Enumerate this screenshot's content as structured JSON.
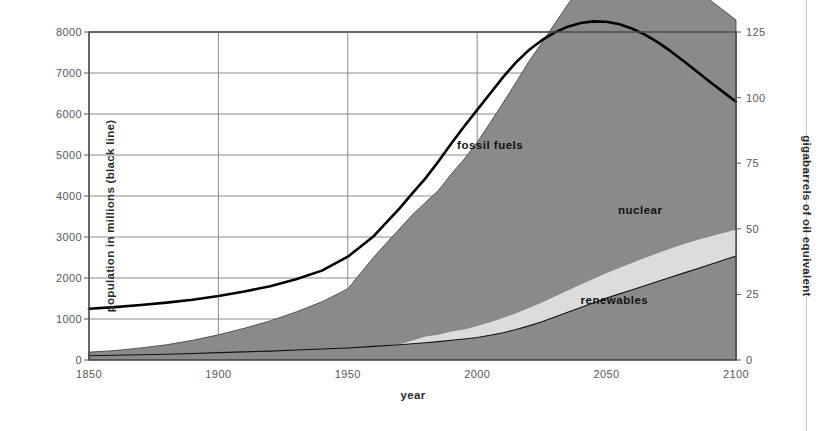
{
  "chart_data": {
    "type": "area",
    "title": "",
    "subtitle": "",
    "xlabel": "year",
    "ylabel": "population in millions (black line)",
    "ylabel_right": "gigabarrels of oil equivalent",
    "xlim": [
      1850,
      2100
    ],
    "ylim": [
      0,
      8000
    ],
    "ylim_right": [
      0,
      125
    ],
    "grid": true,
    "legend_position": "inline-annotations",
    "xticks": [
      1850,
      1900,
      1950,
      2000,
      2050,
      2100
    ],
    "xtick_labels": [
      "1850",
      "1900",
      "1950",
      "2000",
      "2050",
      "2100"
    ],
    "yticks": [
      0,
      1000,
      2000,
      3000,
      4000,
      5000,
      6000,
      7000,
      8000
    ],
    "ytick_labels": [
      "0",
      "1000",
      "2000",
      "3000",
      "4000",
      "5000",
      "6000",
      "7000",
      "8000"
    ],
    "yticks_right": [
      0,
      25,
      50,
      75,
      100,
      125
    ],
    "ytick_labels_right": [
      "0",
      "25",
      "50",
      "75",
      "100",
      "125"
    ],
    "annotations": [
      {
        "text": "fossil fuels",
        "x": 2005,
        "y_right": 82
      },
      {
        "text": "nuclear",
        "x": 2063,
        "y_right": 57
      },
      {
        "text": "renewables",
        "x": 2053,
        "y_right": 23
      }
    ],
    "colors": {
      "fossil_fuels_fill": "#8a8a8a",
      "nuclear_fill": "#dcdcdc",
      "renewables_fill": "#8a8a8a",
      "population_line": "#000000",
      "grid": "#8c8c8c",
      "axis": "#58585a",
      "background": "#ffffff"
    },
    "x": [
      1850,
      1860,
      1870,
      1880,
      1890,
      1900,
      1910,
      1920,
      1930,
      1940,
      1950,
      1960,
      1970,
      1975,
      1980,
      1985,
      1990,
      1995,
      2000,
      2005,
      2010,
      2015,
      2020,
      2025,
      2030,
      2035,
      2040,
      2045,
      2050,
      2055,
      2060,
      2065,
      2070,
      2075,
      2080,
      2085,
      2090,
      2095,
      2100
    ],
    "series": [
      {
        "name": "renewables",
        "units": "gigabarrels of oil equivalent",
        "values": [
          1.6,
          1.8,
          2.0,
          2.2,
          2.5,
          2.8,
          3.1,
          3.4,
          3.8,
          4.2,
          4.6,
          5.2,
          5.8,
          6.2,
          6.6,
          7.0,
          7.5,
          8.0,
          8.6,
          9.4,
          10.4,
          11.6,
          13.0,
          14.6,
          16.4,
          18.2,
          20.0,
          21.8,
          23.6,
          25.2,
          26.8,
          28.4,
          30.0,
          31.6,
          33.2,
          34.8,
          36.4,
          38.0,
          39.6
        ]
      },
      {
        "name": "nuclear",
        "units": "gigabarrels of oil equivalent",
        "values": [
          0,
          0,
          0,
          0,
          0,
          0,
          0,
          0,
          0,
          0,
          0,
          0,
          0.2,
          1.2,
          2.4,
          2.6,
          3.4,
          3.6,
          4.4,
          5.0,
          5.6,
          6.2,
          6.8,
          7.3,
          7.8,
          8.3,
          8.8,
          9.2,
          9.6,
          10.0,
          10.3,
          10.6,
          10.8,
          11.0,
          11.0,
          10.9,
          10.7,
          10.4,
          10.0
        ]
      },
      {
        "name": "fossil fuels",
        "units": "gigabarrels of oil equivalent",
        "values": [
          1.4,
          1.8,
          2.6,
          3.6,
          5.0,
          6.8,
          9.0,
          11.5,
          14.5,
          18.0,
          22.5,
          34.0,
          44.0,
          48.0,
          51.0,
          55.0,
          60.0,
          65.0,
          70.0,
          76.0,
          82.0,
          88.0,
          94.0,
          99.0,
          104.0,
          109.0,
          113.0,
          115.0,
          114.0,
          112.0,
          110.0,
          108.0,
          106.0,
          103.0,
          100.0,
          95.0,
          90.0,
          85.0,
          80.0
        ]
      },
      {
        "name": "population",
        "units": "millions",
        "axis": "left",
        "values": [
          1250,
          1290,
          1340,
          1400,
          1470,
          1560,
          1670,
          1800,
          1970,
          2180,
          2520,
          3020,
          3700,
          4070,
          4430,
          4840,
          5280,
          5700,
          6100,
          6500,
          6900,
          7260,
          7560,
          7800,
          7990,
          8130,
          8220,
          8260,
          8250,
          8190,
          8080,
          7930,
          7740,
          7520,
          7280,
          7030,
          6780,
          6540,
          6300
        ]
      }
    ]
  }
}
